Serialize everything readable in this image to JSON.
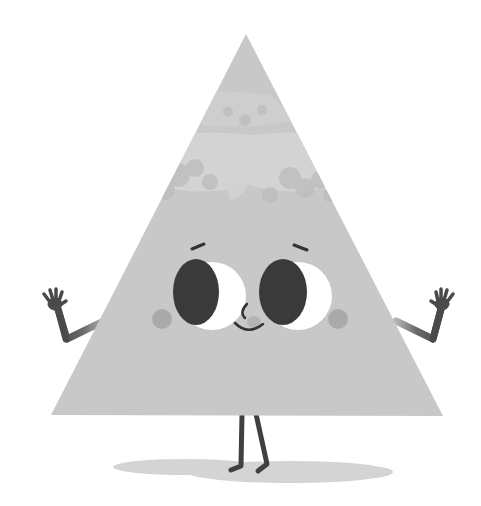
{
  "illustration": {
    "subject": "Cartoon triangle character waving with both hands",
    "colors": {
      "background": "#ffffff",
      "body": "#c8c8c8",
      "body_highlight": "#d6d6d6",
      "body_texture": "#bdbdbd",
      "limbs": "#4a4a4a",
      "pupil": "#3a3a3a",
      "eye_white": "#ffffff",
      "cheek": "#a9a9a9",
      "nose": "#b4b4b4",
      "features": "#333333",
      "shadow": "#d4d4d4"
    },
    "body": {
      "apex": [
        246,
        34
      ],
      "bottom_left": [
        51,
        415
      ],
      "bottom_right": [
        443,
        416
      ]
    },
    "eyes": [
      {
        "side": "left",
        "cx": 210,
        "cy": 295,
        "r": 33
      },
      {
        "side": "right",
        "cx": 296,
        "cy": 295,
        "r": 33
      }
    ],
    "cheeks": [
      {
        "side": "left",
        "cx": 162,
        "cy": 319,
        "r": 10
      },
      {
        "side": "right",
        "cx": 338,
        "cy": 319,
        "r": 10
      }
    ],
    "expression": "smiling",
    "pose": "both arms raised, hands waving",
    "shadow": "ellipse on ground under feet"
  }
}
